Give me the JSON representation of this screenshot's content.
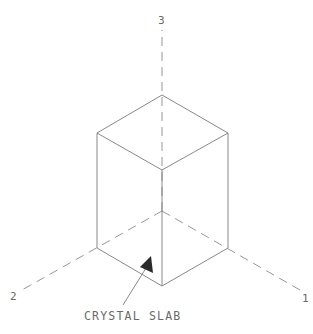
{
  "diagram": {
    "type": "isometric-axes-with-rectangular-prism",
    "axes": [
      {
        "label": "1",
        "direction": "lower-right"
      },
      {
        "label": "2",
        "direction": "lower-left"
      },
      {
        "label": "3",
        "direction": "up"
      }
    ],
    "object": "rectangular prism (slab) with square base on 1-2 plane, extending along axis 3",
    "callout": {
      "text": "CRYSTAL SLAB",
      "points_to": "front-bottom region of prism"
    },
    "colors": {
      "line": "#7a7a7a",
      "text": "#6a6a6a",
      "background": "#ffffff"
    }
  }
}
